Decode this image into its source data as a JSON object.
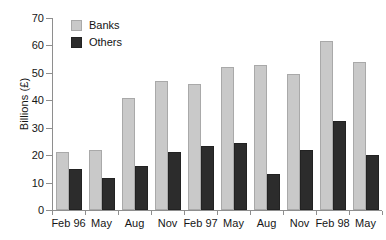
{
  "chart_data": {
    "type": "bar",
    "title": "",
    "subtitle": "",
    "xlabel": "",
    "ylabel": "Billions (£)",
    "ylim": [
      0,
      70
    ],
    "ytick_step": 10,
    "yticks": [
      0,
      10,
      20,
      30,
      40,
      50,
      60,
      70
    ],
    "ytick_labels": [
      "0",
      "10",
      "20",
      "30",
      "40",
      "50",
      "60",
      "70"
    ],
    "grid": false,
    "legend_position": "top-left-inside",
    "categories": [
      "Feb 96",
      "May",
      "Aug",
      "Nov",
      "Feb 97",
      "May",
      "Aug",
      "Nov",
      "Feb 98",
      "May"
    ],
    "series": [
      {
        "name": "Banks",
        "color": "#c9c9c9",
        "edge_color": "#a9a9a9",
        "values": [
          21,
          22,
          41,
          47,
          46,
          52,
          53,
          49.5,
          61.5,
          54
        ]
      },
      {
        "name": "Others",
        "color": "#2c2c2c",
        "edge_color": "#222222",
        "values": [
          15,
          11.5,
          16,
          21,
          23.5,
          24.5,
          13,
          22,
          32.5,
          20
        ]
      }
    ]
  },
  "legend": {
    "items": [
      {
        "label": "Banks",
        "swatch": "banks-swatch"
      },
      {
        "label": "Others",
        "swatch": "others-swatch"
      }
    ]
  },
  "axes": {
    "y_title": "Billions (£)"
  }
}
